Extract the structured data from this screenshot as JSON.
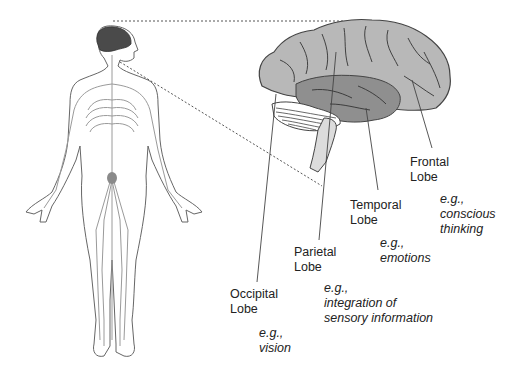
{
  "figure": {
    "colors": {
      "outline": "#555555",
      "nerves": "#9a9a9a",
      "brain_highlight": "#4a4a4a",
      "cerebrum": "#b8b8b8",
      "temporal_lobe": "#8f8f8f",
      "brainstem": "#dcdcdc",
      "leader_lines": "#444444"
    }
  },
  "labels": {
    "frontal": {
      "name_line1": "Frontal",
      "name_line2": "Lobe",
      "eg": "e.g.,",
      "example_line1": "conscious",
      "example_line2": "thinking"
    },
    "temporal": {
      "name_line1": "Temporal",
      "name_line2": "Lobe",
      "eg": "e.g.,",
      "example_line1": "emotions"
    },
    "parietal": {
      "name_line1": "Parietal",
      "name_line2": "Lobe",
      "eg": "e.g.,",
      "example_line1": "integration of",
      "example_line2": "sensory information"
    },
    "occipital": {
      "name_line1": "Occipital",
      "name_line2": "Lobe",
      "eg": "e.g.,",
      "example_line1": "vision"
    }
  }
}
